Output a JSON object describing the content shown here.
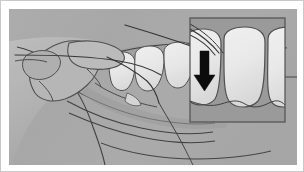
{
  "figure": {
    "caption": "",
    "kind": "line-drawing",
    "frame_border_color": "#c9c9c9",
    "page_background": "#ffffff"
  },
  "illustration": {
    "background_color": "#a9a9a9",
    "outline_color": "#3a3a3a",
    "tooth_fill": "#efefef",
    "tooth_fill_shadow": "#e2e2e2",
    "skin_fill": "#b3b3b3",
    "skin_fill_light": "#bdbdbd",
    "skin_fill_dark": "#9e9e9e",
    "tongue_fill": "#a0a0a0",
    "floss_color": "#2e2e2e",
    "parts": [
      {
        "name": "hand",
        "label": "Hand holding floss"
      },
      {
        "name": "thumb",
        "label": "Thumb"
      },
      {
        "name": "index-finger",
        "label": "Index finger"
      },
      {
        "name": "upper-teeth-row",
        "label": "Upper teeth",
        "tooth_count": 4
      },
      {
        "name": "upper-gum",
        "label": "Upper gum line"
      },
      {
        "name": "lower-lip",
        "label": "Lower lip"
      },
      {
        "name": "chin",
        "label": "Chin"
      },
      {
        "name": "jaw",
        "label": "Jaw contour"
      },
      {
        "name": "floss-strand",
        "label": "Dental floss strand"
      }
    ]
  },
  "inset": {
    "name": "magnified-detail-panel",
    "label": "Magnified view of floss between teeth",
    "x": 181,
    "y": 9,
    "width": 95,
    "height": 104,
    "background_color": "#999999",
    "border_color": "#4a4a4a",
    "tooth_count": 3,
    "arrow": {
      "name": "down-arrow",
      "direction": "down",
      "color": "#000000",
      "label": "Push floss down between teeth"
    }
  }
}
